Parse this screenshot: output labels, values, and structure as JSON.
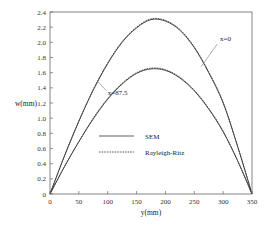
{
  "chart_data": {
    "type": "line",
    "title": "",
    "xlabel": "y(mm)",
    "ylabel": "w(mm)",
    "xlim": [
      0,
      350
    ],
    "ylim": [
      0,
      2.4
    ],
    "xticks": [
      0,
      50,
      100,
      150,
      200,
      250,
      300,
      350
    ],
    "yticks": [
      0,
      0.2,
      0.4,
      0.6,
      0.8,
      1.0,
      1.2,
      1.4,
      1.6,
      1.8,
      2.0,
      2.2,
      2.4
    ],
    "xtick_labels": [
      "0",
      "50",
      "100",
      "150",
      "200",
      "250",
      "300",
      "350"
    ],
    "ytick_labels": [
      "0",
      "0.2",
      "0.4",
      "0.6",
      "0.8",
      "1.0",
      "1.2",
      "1.4",
      "1.6",
      "1.8",
      "2.0",
      "2.2",
      "2.4"
    ],
    "grid": false,
    "legend": {
      "position": "inside-lower-center",
      "entries": [
        {
          "label": "SEM",
          "style": "solid"
        },
        {
          "label": "Rayleigh-Ritz",
          "style": "dashed"
        }
      ]
    },
    "series": [
      {
        "name": "SEM, x=0",
        "style": "solid",
        "x": [
          0,
          25,
          50,
          75,
          100,
          125,
          150,
          175,
          200,
          225,
          250,
          275,
          300,
          325,
          350
        ],
        "values": [
          0,
          0.5,
          0.96,
          1.37,
          1.72,
          2.0,
          2.19,
          2.3,
          2.28,
          2.16,
          1.93,
          1.6,
          1.2,
          0.63,
          0
        ]
      },
      {
        "name": "Rayleigh-Ritz, x=0",
        "style": "dashed",
        "x": [
          0,
          25,
          50,
          75,
          100,
          125,
          150,
          175,
          200,
          225,
          250,
          275,
          300,
          325,
          350
        ],
        "values": [
          0,
          0.5,
          0.96,
          1.38,
          1.73,
          2.01,
          2.2,
          2.31,
          2.29,
          2.17,
          1.94,
          1.61,
          1.21,
          0.63,
          0
        ]
      },
      {
        "name": "SEM, x=87.5",
        "style": "solid",
        "x": [
          0,
          25,
          50,
          75,
          100,
          125,
          150,
          175,
          200,
          225,
          250,
          275,
          300,
          325,
          350
        ],
        "values": [
          0,
          0.36,
          0.69,
          0.99,
          1.25,
          1.45,
          1.59,
          1.65,
          1.63,
          1.53,
          1.36,
          1.12,
          0.82,
          0.44,
          0
        ]
      },
      {
        "name": "Rayleigh-Ritz, x=87.5",
        "style": "dashed",
        "x": [
          0,
          25,
          50,
          75,
          100,
          125,
          150,
          175,
          200,
          225,
          250,
          275,
          300,
          325,
          350
        ],
        "values": [
          0,
          0.36,
          0.69,
          1.0,
          1.26,
          1.46,
          1.6,
          1.66,
          1.64,
          1.54,
          1.37,
          1.13,
          0.83,
          0.44,
          0
        ]
      }
    ],
    "annotations": [
      {
        "text": "x=0",
        "target_series": "x=0",
        "label_at": [
          305,
          2.05
        ]
      },
      {
        "text": "x=87.5",
        "target_series": "x=87.5",
        "label_at": [
          100,
          1.33
        ]
      }
    ]
  },
  "plot": {
    "left": 50,
    "right": 252,
    "top": 12,
    "bottom": 194,
    "line_color": "#333333",
    "axis_color": "#555555"
  }
}
